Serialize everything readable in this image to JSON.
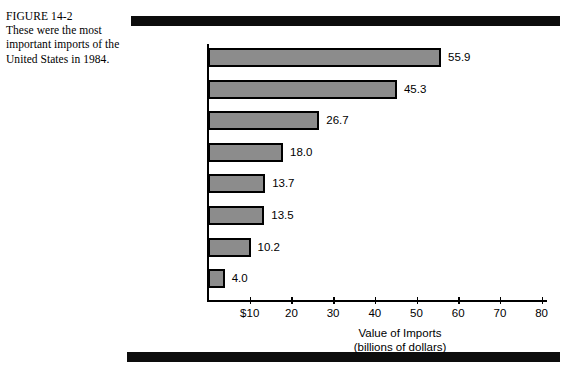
{
  "figure": {
    "number_label": "FIGURE 14-2",
    "caption": "These were the most important imports of the United States in 1984."
  },
  "chart_data": {
    "type": "bar",
    "orientation": "horizontal",
    "title": "",
    "subtitle": "",
    "categories": [
      "Petroleum",
      "Automobiles\nand Parts",
      "Electronic\nEquipment",
      "Food",
      "Chemicals",
      "Clothing",
      "Iron and Steel",
      "Metals"
    ],
    "values": [
      55.9,
      45.3,
      26.7,
      18.0,
      13.7,
      13.5,
      10.2,
      4.0
    ],
    "value_labels": [
      "55.9",
      "45.3",
      "26.7",
      "18.0",
      "13.7",
      "13.5",
      "10.2",
      "4.0"
    ],
    "xlabel": "Value of Imports",
    "xlabel_units": "(billions of dollars)",
    "ylabel": "",
    "xlim": [
      0,
      80
    ],
    "xticks": [
      10,
      20,
      30,
      40,
      50,
      60,
      70,
      80
    ],
    "xtick_labels": [
      "$10",
      "20",
      "30",
      "40",
      "50",
      "60",
      "70",
      "80"
    ],
    "grid": false,
    "legend": false,
    "bar_color": "#8c8c8c",
    "bar_border_color": "#000000",
    "axis_color": "#000000"
  }
}
